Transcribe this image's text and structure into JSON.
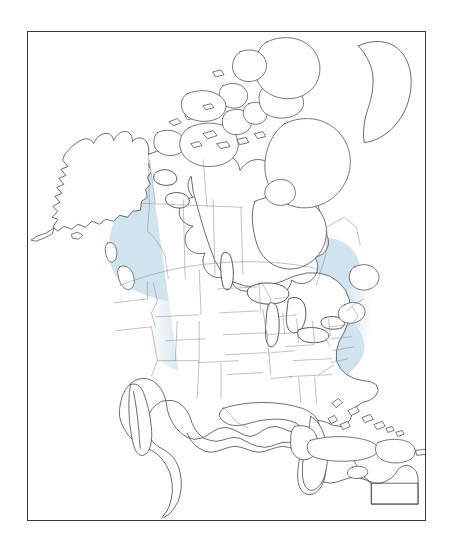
{
  "figure": {
    "type": "range-map",
    "title": "",
    "region": "North America",
    "projection": "conic",
    "frame": {
      "border_color": "#3a3a3a",
      "background_color": "#ffffff",
      "x": 27,
      "y": 31,
      "width": 399,
      "height": 490
    }
  },
  "styles": {
    "range_fill": "#cfe4ee",
    "range_fill_soft": "#dceaf2",
    "coastline_color": "#3c3c3c",
    "subnational_border_color": "#8d8d8d",
    "lake_outline_color": "#2d2d2d",
    "land_fill": "#ffffff",
    "water_fill": "#ffffff"
  },
  "legend": {
    "present": false,
    "items": []
  },
  "labels": {
    "present": false,
    "items": []
  },
  "chart_data": {
    "type": "map",
    "title": "",
    "range_regions_shaded": [
      "Yukon (eastern)",
      "Northwest Territories (southwest)",
      "British Columbia (northeast)",
      "Alberta",
      "Saskatchewan",
      "Manitoba",
      "Ontario",
      "Quebec (southwest)",
      "Minnesota",
      "Wisconsin",
      "Michigan",
      "Iowa",
      "Illinois",
      "Indiana",
      "Ohio",
      "Missouri",
      "Kentucky",
      "Tennessee",
      "West Virginia",
      "Pennsylvania",
      "New York",
      "Arkansas",
      "Mississippi",
      "Alabama",
      "Virginia",
      "Maryland",
      "North Dakota (east)",
      "South Dakota (east)",
      "Nebraska (east)",
      "Kansas (east)"
    ],
    "range_regions_unshaded": [
      "Alaska",
      "Greenland",
      "Canadian Arctic Archipelago",
      "Nunavut (north)",
      "Labrador",
      "Newfoundland",
      "Maritime Provinces",
      "Pacific Northwest coast",
      "California",
      "Nevada",
      "Utah",
      "Arizona",
      "New Mexico",
      "Texas",
      "Florida",
      "Mexico",
      "Central America",
      "Caribbean islands"
    ]
  },
  "geography": {
    "landmasses": [
      "North American mainland",
      "Alaska",
      "Canadian Arctic Archipelago",
      "Greenland (western edge)",
      "Newfoundland",
      "Vancouver Island",
      "Cuba",
      "Hispaniola",
      "Jamaica",
      "Bahamas",
      "Puerto Rico",
      "Baja California"
    ],
    "lakes": [
      "Lake Superior",
      "Lake Michigan",
      "Lake Huron",
      "Lake Erie",
      "Lake Ontario",
      "Great Bear Lake",
      "Great Slave Lake",
      "Lake Winnipeg"
    ]
  }
}
